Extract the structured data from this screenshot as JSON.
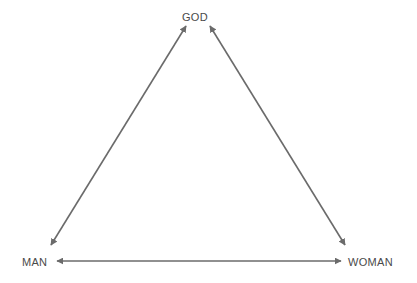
{
  "diagram": {
    "type": "triangle-relationship",
    "nodes": [
      {
        "id": "god",
        "label": "GOD"
      },
      {
        "id": "man",
        "label": "MAN"
      },
      {
        "id": "woman",
        "label": "WOMAN"
      }
    ],
    "edges": [
      {
        "from": "god",
        "to": "man",
        "direction": "bidirectional"
      },
      {
        "from": "god",
        "to": "woman",
        "direction": "bidirectional"
      },
      {
        "from": "man",
        "to": "woman",
        "direction": "bidirectional"
      }
    ],
    "colors": {
      "arrow": "#6b6b6b",
      "text": "#4a4a4a",
      "background": "#ffffff"
    }
  }
}
